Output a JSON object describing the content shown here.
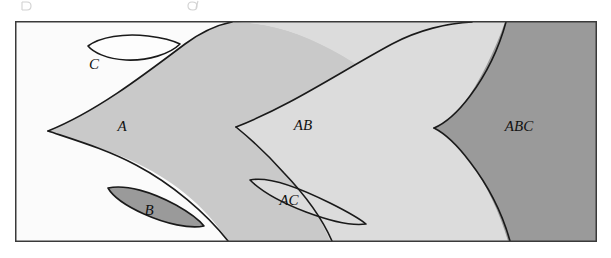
{
  "figure": {
    "frame": {
      "x": 15,
      "y": 21,
      "width": 582,
      "height": 221,
      "border_color": "#3a3a3a",
      "border_width": 1.5,
      "background_color": "#fbfbfb"
    },
    "colors": {
      "background_white": "#fdfdfd",
      "light_gray": "#dcdcdc",
      "mid_gray": "#c9c9c9",
      "dark_gray": "#9a9a9a",
      "outline": "#1a1a1a",
      "page_white": "#ffffff"
    },
    "regions": [
      {
        "id": "region-c",
        "label": "C",
        "fill": "#fdfdfd",
        "label_x": 94,
        "label_y": 66,
        "shape": "lens",
        "note": "unfilled lens in upper-left, outlined only"
      },
      {
        "id": "region-a",
        "label": "A",
        "fill": "#c9c9c9",
        "label_x": 122,
        "label_y": 128,
        "shape": "cusp",
        "note": "mid-gray cusped region, cusp point at left"
      },
      {
        "id": "region-b",
        "label": "B",
        "fill": "#9a9a9a",
        "label_x": 149,
        "label_y": 212,
        "shape": "lens",
        "note": "dark-gray filled lens, lower left"
      },
      {
        "id": "region-ab",
        "label": "AB",
        "fill": "#dcdcdc",
        "label_x": 303,
        "label_y": 127,
        "shape": "cusp",
        "note": "light-gray cusped region, cusp point at left"
      },
      {
        "id": "region-ac",
        "label": "AC",
        "fill": "#dcdcdc",
        "label_x": 289,
        "label_y": 202,
        "shape": "lens",
        "note": "light lens nested inside the mid-gray band"
      },
      {
        "id": "region-abc",
        "label": "ABC",
        "fill": "#9a9a9a",
        "label_x": 519,
        "label_y": 128,
        "shape": "cusp",
        "note": "dark-gray cusped region meeting the right frame edge"
      }
    ],
    "bleed": {
      "present": true,
      "note": "faint descenders of a caption line cropped above the frame"
    }
  }
}
